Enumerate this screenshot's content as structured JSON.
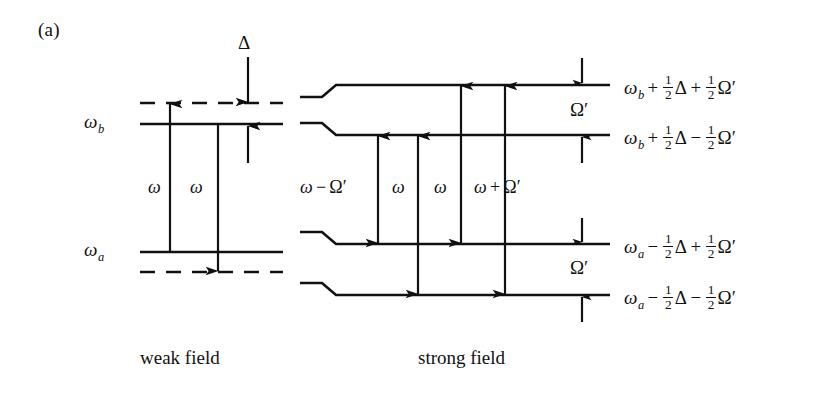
{
  "figure": {
    "panel_label": "(a)",
    "captions": {
      "weak_field": "weak field",
      "strong_field": "strong field"
    }
  },
  "weak_field": {
    "levels": [
      {
        "name": "virtual-upper-dashed",
        "style": "dashed",
        "label": ""
      },
      {
        "name": "omega-b",
        "style": "solid",
        "label": "ω",
        "sub": "b"
      },
      {
        "name": "omega-a",
        "style": "solid",
        "label": "ω",
        "sub": "a"
      },
      {
        "name": "virtual-lower-dashed",
        "style": "dashed",
        "label": ""
      }
    ],
    "transitions": [
      {
        "name": "absorption",
        "label": "ω",
        "direction": "up"
      },
      {
        "name": "emission",
        "label": "ω",
        "direction": "down"
      }
    ],
    "detuning": {
      "symbol": "Δ",
      "name": "detuning-delta"
    }
  },
  "strong_field": {
    "levels": [
      {
        "name": "dressed-level-1",
        "expr": {
          "base": "ω",
          "sub": "b",
          "t1_op": "+",
          "t1_frac": [
            "1",
            "2"
          ],
          "t1_sym": "Δ",
          "t2_op": "+",
          "t2_frac": [
            "1",
            "2"
          ],
          "t2_sym": "Ω′"
        }
      },
      {
        "name": "dressed-level-2",
        "expr": {
          "base": "ω",
          "sub": "b",
          "t1_op": "+",
          "t1_frac": [
            "1",
            "2"
          ],
          "t1_sym": "Δ",
          "t2_op": "−",
          "t2_frac": [
            "1",
            "2"
          ],
          "t2_sym": "Ω′"
        }
      },
      {
        "name": "dressed-level-3",
        "expr": {
          "base": "ω",
          "sub": "a",
          "t1_op": "−",
          "t1_frac": [
            "1",
            "2"
          ],
          "t1_sym": "Δ",
          "t2_op": "+",
          "t2_frac": [
            "1",
            "2"
          ],
          "t2_sym": "Ω′"
        }
      },
      {
        "name": "dressed-level-4",
        "expr": {
          "base": "ω",
          "sub": "a",
          "t1_op": "−",
          "t1_frac": [
            "1",
            "2"
          ],
          "t1_sym": "Δ",
          "t2_op": "−",
          "t2_frac": [
            "1",
            "2"
          ],
          "t2_sym": "Ω′"
        }
      }
    ],
    "splittings": [
      {
        "name": "upper-doublet-splitting",
        "symbol": "Ω′"
      },
      {
        "name": "lower-doublet-splitting",
        "symbol": "Ω′"
      }
    ],
    "transitions": [
      {
        "name": "transition-omega-minus-rabi",
        "base": "ω",
        "op": "−",
        "sym": "Ω′",
        "from_level": 2,
        "to_level": 3
      },
      {
        "name": "transition-omega-center-a",
        "base": "ω",
        "op": "",
        "sym": "",
        "from_level": 2,
        "to_level": 4
      },
      {
        "name": "transition-omega-center-b",
        "base": "ω",
        "op": "",
        "sym": "",
        "from_level": 1,
        "to_level": 3
      },
      {
        "name": "transition-omega-plus-rabi",
        "base": "ω",
        "op": "+",
        "sym": "Ω′",
        "from_level": 1,
        "to_level": 4
      }
    ]
  },
  "style": {
    "line_color": "#111111",
    "background": "#ffffff"
  }
}
